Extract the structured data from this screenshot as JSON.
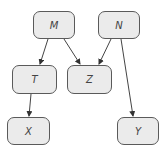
{
  "diagram": {
    "type": "directed-graph",
    "node_fill": "#ebebeb",
    "node_border": "#5a5a5a",
    "edge_color": "#444444",
    "nodes": [
      {
        "id": "M",
        "label": "M",
        "x": 33,
        "y": 11,
        "w": 42,
        "h": 28
      },
      {
        "id": "N",
        "label": "N",
        "x": 98,
        "y": 11,
        "w": 42,
        "h": 28
      },
      {
        "id": "T",
        "label": "T",
        "x": 12,
        "y": 65,
        "w": 45,
        "h": 29
      },
      {
        "id": "Z",
        "label": "Z",
        "x": 67,
        "y": 65,
        "w": 45,
        "h": 29
      },
      {
        "id": "X",
        "label": "X",
        "x": 7,
        "y": 117,
        "w": 43,
        "h": 28
      },
      {
        "id": "Y",
        "label": "Y",
        "x": 117,
        "y": 117,
        "w": 42,
        "h": 28
      }
    ],
    "edges": [
      {
        "from": "M",
        "to": "T"
      },
      {
        "from": "M",
        "to": "Z"
      },
      {
        "from": "N",
        "to": "Z"
      },
      {
        "from": "N",
        "to": "Y"
      },
      {
        "from": "T",
        "to": "X"
      }
    ]
  }
}
